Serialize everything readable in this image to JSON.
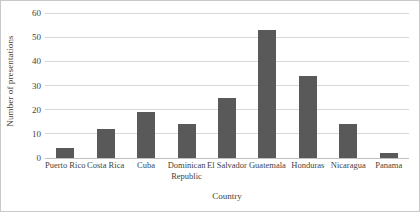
{
  "chart_data": {
    "type": "bar",
    "title": "",
    "xlabel": "Country",
    "ylabel": "Number of presentations",
    "categories": [
      "Puerto Rico",
      "Costa Rica",
      "Cuba",
      "Dominican Republic",
      "El Salvador",
      "Guatemala",
      "Honduras",
      "Nicaragua",
      "Panama"
    ],
    "values": [
      4,
      12,
      19,
      14,
      25,
      53,
      34,
      14,
      2
    ],
    "ylim": [
      0,
      60
    ],
    "yticks": [
      0,
      10,
      20,
      30,
      40,
      50,
      60
    ],
    "ytick_labels": [
      "0",
      "10",
      "20",
      "30",
      "40",
      "50",
      "60"
    ],
    "grid": "horizontal",
    "legend": "none",
    "bar_color": "#595959",
    "gridline_color": "#d9d9d9",
    "border_color": "#c8c8c8"
  }
}
